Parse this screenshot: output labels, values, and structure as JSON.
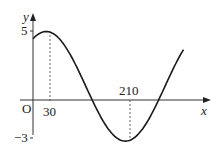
{
  "chart_data": {
    "type": "line",
    "title": "",
    "xlabel": "x",
    "ylabel": "y",
    "origin_label": "O",
    "x_ticks": [
      {
        "value": 30,
        "label": "30"
      },
      {
        "value": 210,
        "label": "210"
      }
    ],
    "y_ticks": [
      {
        "value": 5,
        "label": "5"
      },
      {
        "value": -3,
        "label": "-3"
      }
    ],
    "grid": false,
    "legend": null,
    "series": [
      {
        "name": "curve",
        "description": "sinusoidal curve with maximum (30, 5) and minimum (210, -3)",
        "x": [
          0,
          30,
          60,
          90,
          120,
          150,
          180,
          210,
          240,
          270,
          300,
          330
        ],
        "y": [
          4.46,
          5,
          4.46,
          3,
          1,
          -1,
          -2.46,
          -3,
          -2.46,
          -1,
          1,
          3
        ]
      }
    ],
    "annotations": [
      {
        "type": "dashed-vertical",
        "x": 30,
        "from_y": 0,
        "to_y": 5
      },
      {
        "type": "dashed-vertical",
        "x": 210,
        "from_y": 0,
        "to_y": -3
      }
    ],
    "xlim": [
      0,
      345
    ],
    "ylim": [
      -3.5,
      5.8
    ]
  },
  "labels": {
    "y_axis": "y",
    "x_axis": "x",
    "origin": "O",
    "tick_5": "5",
    "tick_neg3": "−3",
    "tick_30": "30",
    "tick_210": "210"
  },
  "colors": {
    "axis": "#333333",
    "curve": "#1a1a1a",
    "dashed": "#555555"
  }
}
